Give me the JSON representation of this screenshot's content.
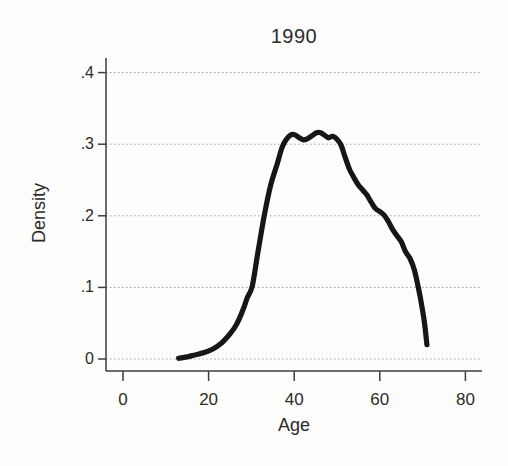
{
  "chart_data": {
    "type": "line",
    "title": "1990",
    "xlabel": "Age",
    "ylabel": "Density",
    "xlim": [
      0,
      80
    ],
    "ylim": [
      0,
      0.4
    ],
    "xticks": [
      0,
      20,
      40,
      60,
      80
    ],
    "xtick_labels": [
      "0",
      "20",
      "40",
      "60",
      "80"
    ],
    "yticks": [
      0,
      0.1,
      0.2,
      0.3,
      0.4
    ],
    "ytick_labels": [
      "0",
      ".1",
      ".2",
      ".3",
      ".4"
    ],
    "grid": "horizontal dotted gridlines at each y tick",
    "legend": "none",
    "series": [
      {
        "name": "age-density-1990",
        "style": "thick solid kernel-density curve",
        "x": [
          13,
          15,
          17,
          19,
          21,
          23,
          25,
          26.5,
          28,
          29,
          30.2,
          31.5,
          33,
          34.5,
          36,
          37.2,
          38.2,
          39.2,
          40.2,
          41.2,
          42.2,
          43.2,
          44.2,
          45.2,
          46.2,
          47.2,
          48,
          49,
          50,
          51,
          52,
          53,
          54,
          55,
          56,
          57,
          58,
          59,
          60,
          61,
          62,
          63,
          64,
          65,
          66,
          67,
          68,
          69,
          69.8,
          70.5,
          71
        ],
        "y": [
          0.001,
          0.003,
          0.006,
          0.009,
          0.014,
          0.022,
          0.035,
          0.048,
          0.068,
          0.085,
          0.102,
          0.148,
          0.2,
          0.243,
          0.272,
          0.296,
          0.307,
          0.313,
          0.313,
          0.309,
          0.306,
          0.308,
          0.312,
          0.316,
          0.316,
          0.312,
          0.309,
          0.311,
          0.307,
          0.298,
          0.28,
          0.264,
          0.253,
          0.243,
          0.236,
          0.229,
          0.219,
          0.21,
          0.206,
          0.201,
          0.192,
          0.181,
          0.172,
          0.164,
          0.15,
          0.141,
          0.126,
          0.1,
          0.075,
          0.048,
          0.02
        ]
      }
    ]
  },
  "colors": {
    "background": "#fdfdfc",
    "curve": "#161616",
    "axis": "#3d3d3d",
    "grid": "#9b9b9b",
    "text": "#2b2b2b"
  }
}
